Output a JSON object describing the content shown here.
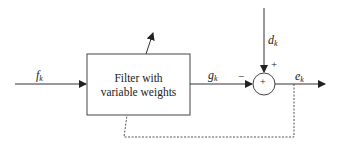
{
  "diagram": {
    "type": "adaptive-filter-block-diagram",
    "colors": {
      "line": "#333333",
      "background": "#ffffff"
    },
    "nodes": {
      "filter": {
        "line1": "Filter with",
        "line2": "variable weights"
      },
      "summer": {
        "symbol": "+"
      }
    },
    "signals": {
      "input": {
        "name": "f",
        "sub": "k"
      },
      "filter_output": {
        "name": "g",
        "sub": "k"
      },
      "desired": {
        "name": "d",
        "sub": "k"
      },
      "error": {
        "name": "e",
        "sub": "k"
      }
    },
    "signs": {
      "filter_output_sign": "−",
      "desired_sign": "+"
    },
    "edges": [
      {
        "from": "input",
        "to": "filter",
        "label": "f_k"
      },
      {
        "from": "filter",
        "to": "summer",
        "label": "g_k",
        "sign": "−"
      },
      {
        "from": "desired",
        "to": "summer",
        "label": "d_k",
        "sign": "+"
      },
      {
        "from": "summer",
        "to": "output",
        "label": "e_k"
      },
      {
        "from": "output",
        "to": "filter",
        "style": "dashed",
        "role": "feedback"
      }
    ]
  }
}
